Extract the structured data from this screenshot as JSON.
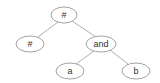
{
  "diagram": {
    "type": "tree",
    "nodes": [
      {
        "id": "n0",
        "label": "#",
        "cx": 64,
        "cy": 15,
        "rx": 13,
        "ry": 8
      },
      {
        "id": "n1",
        "label": "#",
        "cx": 30,
        "cy": 44,
        "rx": 14,
        "ry": 8
      },
      {
        "id": "n2",
        "label": "and",
        "cx": 101,
        "cy": 44,
        "rx": 15,
        "ry": 8
      },
      {
        "id": "n3",
        "label": "a",
        "cx": 70,
        "cy": 71,
        "rx": 14,
        "ry": 8
      },
      {
        "id": "n4",
        "label": "b",
        "cx": 136,
        "cy": 71,
        "rx": 14,
        "ry": 8
      }
    ],
    "edges": [
      {
        "from": "n0",
        "to": "n1"
      },
      {
        "from": "n0",
        "to": "n2"
      },
      {
        "from": "n2",
        "to": "n3"
      },
      {
        "from": "n2",
        "to": "n4"
      }
    ]
  }
}
